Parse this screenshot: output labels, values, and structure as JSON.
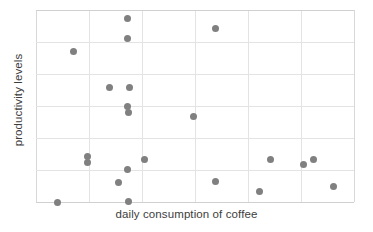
{
  "chart_data": {
    "type": "scatter",
    "title": "",
    "xlabel": "daily consumption of coffee",
    "ylabel": "productivity levels",
    "grid": true,
    "legend": null,
    "xlim": [
      0,
      6
    ],
    "ylim": [
      0,
      6
    ],
    "xticklabels": [],
    "yticklabels": [],
    "marker_color": "#808080",
    "gridline_color": "#e3e3e3",
    "points": [
      {
        "x": 0.4,
        "y": 0.0
      },
      {
        "x": 0.7,
        "y": 4.7
      },
      {
        "x": 0.98,
        "y": 1.41
      },
      {
        "x": 0.98,
        "y": 1.25
      },
      {
        "x": 1.38,
        "y": 3.57
      },
      {
        "x": 1.55,
        "y": 0.62
      },
      {
        "x": 1.72,
        "y": 5.1
      },
      {
        "x": 1.72,
        "y": 2.97
      },
      {
        "x": 1.74,
        "y": 2.81
      },
      {
        "x": 1.72,
        "y": 1.03
      },
      {
        "x": 1.73,
        "y": 5.72
      },
      {
        "x": 1.74,
        "y": 0.03
      },
      {
        "x": 1.76,
        "y": 3.59
      },
      {
        "x": 2.04,
        "y": 1.34
      },
      {
        "x": 2.98,
        "y": 2.66
      },
      {
        "x": 3.38,
        "y": 5.41
      },
      {
        "x": 3.38,
        "y": 0.63
      },
      {
        "x": 4.22,
        "y": 0.34
      },
      {
        "x": 4.42,
        "y": 1.34
      },
      {
        "x": 5.04,
        "y": 1.16
      },
      {
        "x": 5.23,
        "y": 1.34
      },
      {
        "x": 5.62,
        "y": 0.47
      }
    ]
  }
}
